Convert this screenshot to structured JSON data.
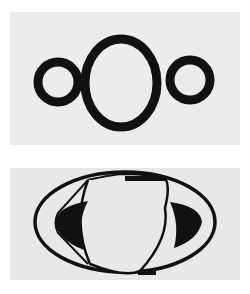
{
  "figure": {
    "colors": {
      "background": "#ffffff",
      "panel": "#ececec",
      "ink": "#111111"
    },
    "panels": [
      {
        "id": "top",
        "depiction": "central oval flanked by two small circles"
      },
      {
        "id": "bottom",
        "depiction": "sphere with elliptical ring and dark gaps"
      }
    ]
  }
}
